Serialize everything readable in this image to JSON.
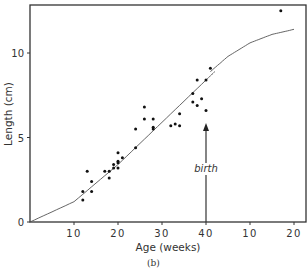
{
  "chart_data": {
    "type": "scatter",
    "title": "",
    "caption": "(b)",
    "xlabel": "Age (weeks)",
    "ylabel": "Length (cm)",
    "x_tick_labels": [
      "10",
      "20",
      "30",
      "40",
      "10",
      "20"
    ],
    "x_tick_note": "Weeks 10–40 are gestational age; the final 10 and 20 are weeks after birth",
    "y_tick_labels": [
      "0",
      "5",
      "10"
    ],
    "ylim": [
      0,
      12.9
    ],
    "xlim_weeks_from_conception": [
      0,
      62
    ],
    "grid": false,
    "annotation": {
      "text": "birth",
      "x_week": 40,
      "arrow": "up",
      "arrow_from_cm": 0,
      "arrow_to_cm": 5.8
    },
    "points": [
      {
        "x": 12,
        "y": 1.3
      },
      {
        "x": 12,
        "y": 1.8
      },
      {
        "x": 13,
        "y": 3.0
      },
      {
        "x": 14,
        "y": 2.4
      },
      {
        "x": 14,
        "y": 1.8
      },
      {
        "x": 17,
        "y": 3.0
      },
      {
        "x": 18,
        "y": 2.6
      },
      {
        "x": 18,
        "y": 3.0
      },
      {
        "x": 19,
        "y": 3.2
      },
      {
        "x": 19,
        "y": 3.4
      },
      {
        "x": 20,
        "y": 3.5
      },
      {
        "x": 20,
        "y": 3.6
      },
      {
        "x": 20,
        "y": 4.1
      },
      {
        "x": 20,
        "y": 3.2
      },
      {
        "x": 21,
        "y": 3.8
      },
      {
        "x": 24,
        "y": 4.4
      },
      {
        "x": 24,
        "y": 5.5
      },
      {
        "x": 26,
        "y": 6.8
      },
      {
        "x": 26,
        "y": 6.1
      },
      {
        "x": 28,
        "y": 6.1
      },
      {
        "x": 28,
        "y": 5.6
      },
      {
        "x": 28,
        "y": 5.5
      },
      {
        "x": 32,
        "y": 5.7
      },
      {
        "x": 33,
        "y": 5.8
      },
      {
        "x": 34,
        "y": 5.7
      },
      {
        "x": 34,
        "y": 6.4
      },
      {
        "x": 37,
        "y": 7.1
      },
      {
        "x": 37,
        "y": 7.6
      },
      {
        "x": 38,
        "y": 8.4
      },
      {
        "x": 38,
        "y": 6.9
      },
      {
        "x": 39,
        "y": 7.3
      },
      {
        "x": 40,
        "y": 8.4
      },
      {
        "x": 40,
        "y": 6.6
      },
      {
        "x": 41,
        "y": 9.1
      },
      {
        "x": 57,
        "y": 12.5
      }
    ],
    "series": [
      {
        "name": "prenatal fit",
        "x": [
          0,
          10,
          20,
          30,
          40,
          42
        ],
        "y": [
          0,
          1.2,
          3.4,
          5.9,
          8.4,
          8.9
        ]
      },
      {
        "name": "postnatal fit",
        "x": [
          41,
          45,
          50,
          55,
          60
        ],
        "y": [
          8.9,
          9.8,
          10.6,
          11.1,
          11.4
        ]
      }
    ]
  }
}
